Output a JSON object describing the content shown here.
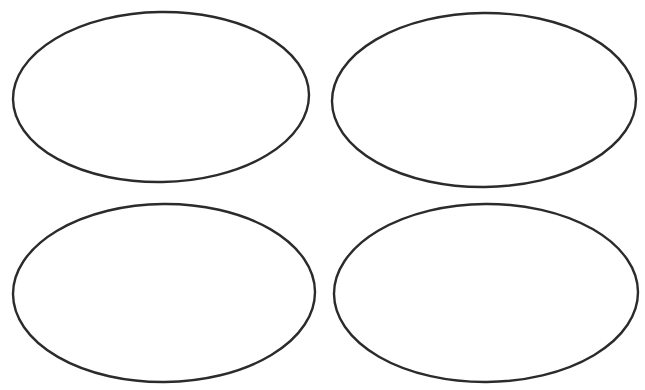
{
  "document": {
    "title": "Four Ellipse Blank Template",
    "kind": "graphic-organizer",
    "background_color": "#ffffff",
    "width": 645,
    "height": 390
  },
  "diagram_data": {
    "type": "shape-layout",
    "layout": "2x2-grid",
    "shape_count": 4,
    "stroke_color": "#2b2b2b",
    "fill_color": "#ffffff",
    "stroke_width": 2.4,
    "shapes": [
      {
        "name": "ellipse-top-left",
        "row": 1,
        "column": 1,
        "cx": 161,
        "cy": 97,
        "rx": 148,
        "ry": 85,
        "label": "",
        "rotation": -1.0
      },
      {
        "name": "ellipse-top-right",
        "row": 1,
        "column": 2,
        "cx": 484,
        "cy": 100,
        "rx": 152,
        "ry": 87,
        "label": "",
        "rotation": -0.6
      },
      {
        "name": "ellipse-bottom-left",
        "row": 2,
        "column": 1,
        "cx": 164,
        "cy": 293,
        "rx": 151,
        "ry": 89,
        "label": "",
        "rotation": -0.5
      },
      {
        "name": "ellipse-bottom-right",
        "row": 2,
        "column": 2,
        "cx": 486,
        "cy": 293,
        "rx": 152,
        "ry": 89,
        "label": "",
        "rotation": -0.4
      }
    ]
  }
}
